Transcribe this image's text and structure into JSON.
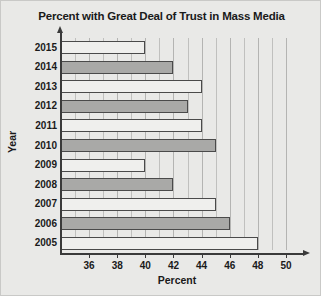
{
  "chart_data": {
    "type": "bar",
    "orientation": "horizontal",
    "title": "Percent with Great Deal of Trust in Mass Media",
    "xlabel": "Percent",
    "ylabel": "Year",
    "categories": [
      "2015",
      "2014",
      "2013",
      "2012",
      "2011",
      "2010",
      "2009",
      "2008",
      "2007",
      "2006",
      "2005"
    ],
    "values": [
      40,
      42,
      44,
      43,
      44,
      45,
      40,
      42,
      45,
      46,
      48
    ],
    "xlim": [
      34,
      50.5
    ],
    "xticks": [
      36,
      38,
      40,
      42,
      44,
      46,
      48,
      50
    ],
    "xtick_labels": [
      "36",
      "38",
      "40",
      "42",
      "44",
      "46",
      "48",
      "50"
    ],
    "minor_tick_step": 1,
    "grid": "vertical",
    "legend": "none",
    "bar_colors": [
      "#efefed",
      "#a9a9a7"
    ],
    "bar_edge_color": "#4a4a4a",
    "axis_color": "#3a3a3a",
    "gridline_color": "#b4b4b2",
    "background_color": "#e9e9e7",
    "text_color": "#1a1a1a"
  }
}
